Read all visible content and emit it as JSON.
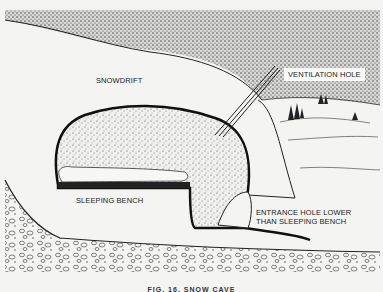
{
  "diagram": {
    "labels": {
      "snowdrift": "SNOWDRIFT",
      "ventilation_hole": "VENTILATION HOLE",
      "sleeping_bench": "SLEEPING BENCH",
      "entrance_line1": "ENTRANCE HOLE LOWER",
      "entrance_line2": "THAN SLEEPING BENCH"
    },
    "caption": "FIG. 16. SNOW CAVE",
    "colors": {
      "background": "#f4f4f2",
      "ink": "#1a1a1a",
      "stipple": "#555555"
    }
  }
}
